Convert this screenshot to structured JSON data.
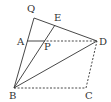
{
  "diagram": {
    "type": "geometry",
    "stroke_color": "#333333",
    "points": {
      "Q": {
        "label": "Q",
        "x": 34,
        "y": 18,
        "lx": 27,
        "ly": 12
      },
      "E": {
        "label": "E",
        "x": 55,
        "y": 25,
        "lx": 54,
        "ly": 21
      },
      "A": {
        "label": "A",
        "x": 27,
        "y": 41,
        "lx": 17,
        "ly": 45
      },
      "P": {
        "label": "P",
        "x": 43,
        "y": 41,
        "lx": 44,
        "ly": 50
      },
      "D": {
        "label": "D",
        "x": 97,
        "y": 41,
        "lx": 99,
        "ly": 45
      },
      "B": {
        "label": "B",
        "x": 14,
        "y": 88,
        "lx": 9,
        "ly": 99
      },
      "C": {
        "label": "C",
        "x": 86,
        "y": 88,
        "lx": 85,
        "ly": 99
      }
    },
    "solid_segments": [
      [
        "Q",
        "B"
      ],
      [
        "Q",
        "D"
      ],
      [
        "B",
        "E"
      ],
      [
        "B",
        "D"
      ],
      [
        "A",
        "P"
      ]
    ],
    "dashed_segments": [
      [
        "P",
        "D"
      ],
      [
        "B",
        "C"
      ],
      [
        "C",
        "D"
      ]
    ]
  }
}
